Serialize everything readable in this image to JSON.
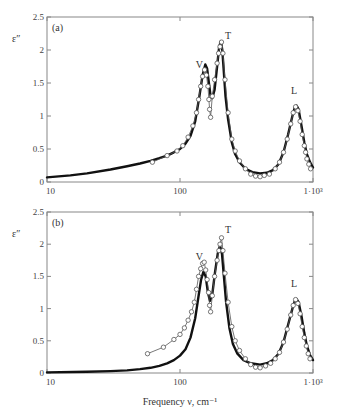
{
  "chart_data": [
    {
      "type": "line",
      "panel": "(a)",
      "ylabel": "ε″",
      "xlabel": "",
      "xscale": "log",
      "xlim": [
        10,
        1000
      ],
      "ylim": [
        0,
        2.5
      ],
      "yticks": [
        "0",
        "0.5",
        "1",
        "1.5",
        "2",
        "2.5"
      ],
      "xticks": [
        "10",
        "100",
        "1·10³"
      ],
      "annotations": [
        {
          "text": "V",
          "x": 140,
          "y": 1.72
        },
        {
          "text": "T",
          "x": 230,
          "y": 2.17
        },
        {
          "text": "L",
          "x": 720,
          "y": 1.33
        }
      ],
      "series": [
        {
          "name": "model (thick line)",
          "style": "thick",
          "points": [
            [
              10,
              0.07
            ],
            [
              15,
              0.1
            ],
            [
              20,
              0.13
            ],
            [
              30,
              0.19
            ],
            [
              40,
              0.24
            ],
            [
              50,
              0.28
            ],
            [
              60,
              0.32
            ],
            [
              70,
              0.36
            ],
            [
              80,
              0.4
            ],
            [
              90,
              0.45
            ],
            [
              100,
              0.5
            ],
            [
              110,
              0.58
            ],
            [
              120,
              0.7
            ],
            [
              130,
              0.92
            ],
            [
              140,
              1.3
            ],
            [
              148,
              1.62
            ],
            [
              155,
              1.78
            ],
            [
              160,
              1.72
            ],
            [
              165,
              1.5
            ],
            [
              170,
              1.3
            ],
            [
              175,
              1.27
            ],
            [
              182,
              1.4
            ],
            [
              190,
              1.75
            ],
            [
              197,
              2.05
            ],
            [
              203,
              2.13
            ],
            [
              208,
              2.0
            ],
            [
              213,
              1.7
            ],
            [
              220,
              1.3
            ],
            [
              230,
              0.95
            ],
            [
              245,
              0.6
            ],
            [
              260,
              0.42
            ],
            [
              280,
              0.3
            ],
            [
              310,
              0.2
            ],
            [
              350,
              0.15
            ],
            [
              400,
              0.13
            ],
            [
              450,
              0.14
            ],
            [
              500,
              0.18
            ],
            [
              550,
              0.27
            ],
            [
              600,
              0.45
            ],
            [
              650,
              0.72
            ],
            [
              700,
              1.0
            ],
            [
              730,
              1.13
            ],
            [
              750,
              1.16
            ],
            [
              780,
              1.1
            ],
            [
              820,
              0.85
            ],
            [
              860,
              0.6
            ],
            [
              900,
              0.42
            ],
            [
              950,
              0.3
            ],
            [
              1000,
              0.22
            ]
          ]
        },
        {
          "name": "experiment (circles)",
          "style": "thin-circles",
          "points": [
            [
              62,
              0.3
            ],
            [
              80,
              0.4
            ],
            [
              95,
              0.47
            ],
            [
              105,
              0.55
            ],
            [
              115,
              0.68
            ],
            [
              125,
              0.85
            ],
            [
              133,
              1.05
            ],
            [
              138,
              1.25
            ],
            [
              143,
              1.45
            ],
            [
              148,
              1.6
            ],
            [
              153,
              1.7
            ],
            [
              158,
              1.62
            ],
            [
              162,
              1.45
            ],
            [
              165,
              1.25
            ],
            [
              167,
              1.1
            ],
            [
              170,
              0.98
            ],
            [
              175,
              1.3
            ],
            [
              182,
              1.55
            ],
            [
              190,
              1.8
            ],
            [
              195,
              1.95
            ],
            [
              200,
              2.05
            ],
            [
              205,
              2.12
            ],
            [
              210,
              1.95
            ],
            [
              218,
              1.55
            ],
            [
              230,
              1.05
            ],
            [
              245,
              0.65
            ],
            [
              260,
              0.47
            ],
            [
              280,
              0.32
            ],
            [
              310,
              0.2
            ],
            [
              340,
              0.12
            ],
            [
              370,
              0.09
            ],
            [
              400,
              0.08
            ],
            [
              430,
              0.1
            ],
            [
              470,
              0.12
            ],
            [
              520,
              0.2
            ],
            [
              560,
              0.3
            ],
            [
              600,
              0.45
            ],
            [
              640,
              0.65
            ],
            [
              680,
              0.88
            ],
            [
              710,
              1.05
            ],
            [
              740,
              1.14
            ],
            [
              770,
              1.08
            ],
            [
              800,
              0.92
            ],
            [
              830,
              0.72
            ],
            [
              860,
              0.55
            ],
            [
              880,
              0.45
            ],
            [
              900,
              0.35
            ],
            [
              930,
              0.27
            ],
            [
              960,
              0.2
            ]
          ]
        }
      ]
    },
    {
      "type": "line",
      "panel": "(b)",
      "ylabel": "ε″",
      "xlabel": "Frequency ν, cm⁻¹",
      "xscale": "log",
      "xlim": [
        10,
        1000
      ],
      "ylim": [
        0,
        2.5
      ],
      "yticks": [
        "0",
        "0.5",
        "1",
        "1.5",
        "2",
        "2.5"
      ],
      "xticks": [
        "10",
        "100",
        "1·10³"
      ],
      "annotations": [
        {
          "text": "V",
          "x": 140,
          "y": 1.75
        },
        {
          "text": "T",
          "x": 230,
          "y": 2.18
        },
        {
          "text": "L",
          "x": 720,
          "y": 1.33
        }
      ],
      "series": [
        {
          "name": "model (thick line)",
          "style": "thick",
          "points": [
            [
              10,
              0.01
            ],
            [
              20,
              0.02
            ],
            [
              30,
              0.03
            ],
            [
              40,
              0.04
            ],
            [
              50,
              0.06
            ],
            [
              60,
              0.08
            ],
            [
              70,
              0.11
            ],
            [
              80,
              0.15
            ],
            [
              90,
              0.2
            ],
            [
              100,
              0.27
            ],
            [
              110,
              0.37
            ],
            [
              120,
              0.55
            ],
            [
              130,
              0.85
            ],
            [
              138,
              1.2
            ],
            [
              144,
              1.45
            ],
            [
              150,
              1.57
            ],
            [
              156,
              1.5
            ],
            [
              162,
              1.25
            ],
            [
              168,
              1.12
            ],
            [
              175,
              1.22
            ],
            [
              183,
              1.55
            ],
            [
              192,
              1.85
            ],
            [
              200,
              1.98
            ],
            [
              207,
              1.85
            ],
            [
              214,
              1.5
            ],
            [
              222,
              1.1
            ],
            [
              235,
              0.7
            ],
            [
              250,
              0.45
            ],
            [
              270,
              0.3
            ],
            [
              300,
              0.2
            ],
            [
              340,
              0.15
            ],
            [
              400,
              0.13
            ],
            [
              450,
              0.15
            ],
            [
              500,
              0.2
            ],
            [
              550,
              0.3
            ],
            [
              600,
              0.48
            ],
            [
              650,
              0.75
            ],
            [
              700,
              1.0
            ],
            [
              730,
              1.12
            ],
            [
              750,
              1.15
            ],
            [
              780,
              1.1
            ],
            [
              820,
              0.88
            ],
            [
              860,
              0.62
            ],
            [
              900,
              0.42
            ],
            [
              950,
              0.28
            ],
            [
              1000,
              0.2
            ]
          ]
        },
        {
          "name": "experiment (circles)",
          "style": "thin-circles",
          "points": [
            [
              57,
              0.3
            ],
            [
              75,
              0.4
            ],
            [
              90,
              0.52
            ],
            [
              100,
              0.6
            ],
            [
              108,
              0.7
            ],
            [
              115,
              0.82
            ],
            [
              122,
              0.95
            ],
            [
              128,
              1.1
            ],
            [
              133,
              1.3
            ],
            [
              138,
              1.5
            ],
            [
              143,
              1.62
            ],
            [
              148,
              1.7
            ],
            [
              152,
              1.72
            ],
            [
              156,
              1.6
            ],
            [
              160,
              1.45
            ],
            [
              164,
              1.25
            ],
            [
              167,
              1.05
            ],
            [
              170,
              0.95
            ],
            [
              175,
              1.2
            ],
            [
              182,
              1.5
            ],
            [
              190,
              1.75
            ],
            [
              196,
              1.9
            ],
            [
              200,
              2.0
            ],
            [
              205,
              2.1
            ],
            [
              210,
              1.9
            ],
            [
              218,
              1.55
            ],
            [
              230,
              1.1
            ],
            [
              245,
              0.72
            ],
            [
              260,
              0.5
            ],
            [
              280,
              0.35
            ],
            [
              310,
              0.22
            ],
            [
              340,
              0.13
            ],
            [
              370,
              0.09
            ],
            [
              400,
              0.08
            ],
            [
              440,
              0.11
            ],
            [
              480,
              0.15
            ],
            [
              520,
              0.22
            ],
            [
              560,
              0.32
            ],
            [
              600,
              0.48
            ],
            [
              640,
              0.68
            ],
            [
              680,
              0.9
            ],
            [
              710,
              1.05
            ],
            [
              740,
              1.14
            ],
            [
              770,
              1.08
            ],
            [
              800,
              0.92
            ],
            [
              830,
              0.72
            ],
            [
              860,
              0.55
            ],
            [
              890,
              0.42
            ],
            [
              920,
              0.3
            ],
            [
              950,
              0.22
            ]
          ]
        }
      ]
    }
  ],
  "figure": {
    "panels": [
      {
        "label": "(a)",
        "ylabel": "ε″"
      },
      {
        "label": "(b)",
        "ylabel": "ε″"
      }
    ],
    "xlabel": "Frequency ν, cm⁻¹"
  }
}
